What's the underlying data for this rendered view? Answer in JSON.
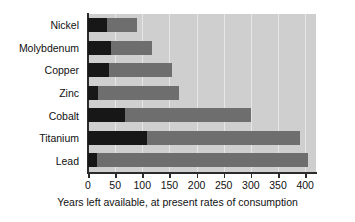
{
  "chart_data": {
    "type": "bar",
    "orientation": "horizontal",
    "title": "",
    "subtitle": "",
    "xlabel": "Years left available, at present rates of consumption",
    "ylabel": "",
    "categories": [
      "Nickel",
      "Molybdenum",
      "Copper",
      "Zinc",
      "Cobalt",
      "Titanium",
      "Lead"
    ],
    "series": [
      {
        "name": "reserves",
        "color": "#171717",
        "values": [
          35,
          42,
          38,
          18,
          68,
          108,
          17
        ]
      },
      {
        "name": "reserve base",
        "color": "#6e6e6e",
        "values": [
          90,
          118,
          155,
          168,
          300,
          390,
          405
        ]
      }
    ],
    "stacked": false,
    "overlaid": true,
    "xlim": [
      0,
      420
    ],
    "xticks": [
      0,
      50,
      100,
      150,
      200,
      250,
      300,
      350,
      400
    ],
    "xticklabels": [
      "0",
      "50",
      "100",
      "150",
      "200",
      "250",
      "300",
      "350",
      "400"
    ],
    "grid": true,
    "grid_axis": "x",
    "legend": "none",
    "plot_background": "#cfcfcf"
  },
  "colors": {
    "dark_segment": "#171717",
    "mid_segment": "#6e6e6e",
    "plot_bg": "#cfcfcf",
    "gridline": "#e6e6e6",
    "axis": "#2b2b2b",
    "text": "#111111"
  }
}
